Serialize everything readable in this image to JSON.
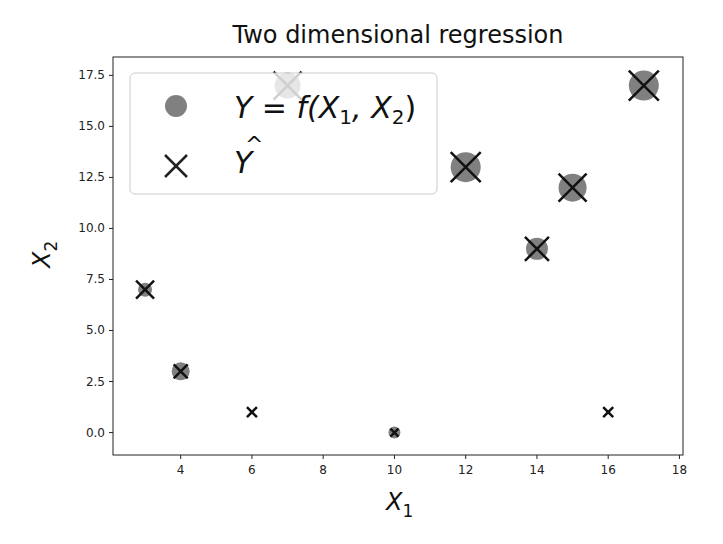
{
  "chart_data": {
    "type": "scatter",
    "title": "Two dimensional regression",
    "xlabel": "X_1",
    "ylabel": "X_2",
    "xlim": [
      2.1,
      18.1
    ],
    "ylim": [
      -1.1,
      18.4
    ],
    "xticks": [
      "4",
      "6",
      "8",
      "10",
      "12",
      "14",
      "16",
      "18"
    ],
    "yticks": [
      "0.0",
      "2.5",
      "5.0",
      "7.5",
      "10.0",
      "12.5",
      "15.0",
      "17.5"
    ],
    "grid": false,
    "legend_position": "upper left",
    "legend": [
      {
        "marker": "circle",
        "label": "Y = f(X1, X2)"
      },
      {
        "marker": "x",
        "label": "Ŷ"
      }
    ],
    "series": [
      {
        "name": "Y = f(X1, X2)",
        "marker": "circle",
        "color": "#808080",
        "points": [
          {
            "x": 3,
            "y": 7,
            "size": 7
          },
          {
            "x": 4,
            "y": 3,
            "size": 9
          },
          {
            "x": 6,
            "y": 1,
            "size": 2
          },
          {
            "x": 7,
            "y": 17,
            "size": 13
          },
          {
            "x": 10,
            "y": 0,
            "size": 6
          },
          {
            "x": 12,
            "y": 13,
            "size": 15
          },
          {
            "x": 14,
            "y": 9,
            "size": 11
          },
          {
            "x": 15,
            "y": 12,
            "size": 14
          },
          {
            "x": 16,
            "y": 1,
            "size": 2
          },
          {
            "x": 17,
            "y": 17,
            "size": 15
          }
        ]
      },
      {
        "name": "Ŷ",
        "marker": "x",
        "color": "#111111",
        "points": [
          {
            "x": 3,
            "y": 7,
            "size": 9
          },
          {
            "x": 4,
            "y": 3,
            "size": 7
          },
          {
            "x": 6,
            "y": 1,
            "size": 5
          },
          {
            "x": 7,
            "y": 17,
            "size": 14
          },
          {
            "x": 10,
            "y": 0,
            "size": 4
          },
          {
            "x": 12,
            "y": 13,
            "size": 15
          },
          {
            "x": 14,
            "y": 9,
            "size": 12
          },
          {
            "x": 15,
            "y": 12,
            "size": 14
          },
          {
            "x": 16,
            "y": 1,
            "size": 5
          },
          {
            "x": 17,
            "y": 17,
            "size": 15
          }
        ]
      }
    ]
  },
  "labels": {
    "title": "Two dimensional regression",
    "xlabel_main": "X",
    "xlabel_sub": "1",
    "ylabel_main": "X",
    "ylabel_sub": "2",
    "legend_y": "Y = f(X",
    "legend_sub1": "1",
    "legend_mid": ", X",
    "legend_sub2": "2",
    "legend_close": ")",
    "legend_yhat": "Y",
    "legend_hat": "^"
  }
}
